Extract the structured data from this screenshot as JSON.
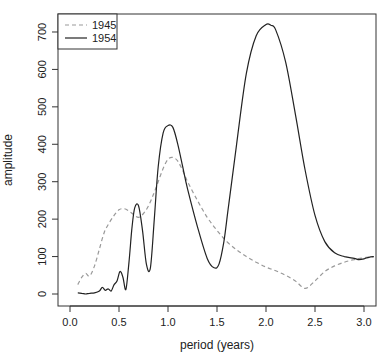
{
  "chart_data": {
    "type": "line",
    "title": "",
    "xlabel": "period (years)",
    "ylabel": "amplitude",
    "xlim": [
      -0.12,
      3.12
    ],
    "ylim": [
      -28,
      752
    ],
    "xticks": [
      0.0,
      0.5,
      1.0,
      1.5,
      2.0,
      2.5,
      3.0
    ],
    "xtick_labels": [
      "0.0",
      "0.5",
      "1.0",
      "1.5",
      "2.0",
      "2.5",
      "3.0"
    ],
    "yticks": [
      0,
      100,
      200,
      300,
      400,
      500,
      600,
      700
    ],
    "ytick_labels": [
      "0",
      "100",
      "200",
      "300",
      "400",
      "500",
      "600",
      "700"
    ],
    "grid": false,
    "legend_position": "top-left",
    "series": [
      {
        "name": "1945",
        "style": "dashed",
        "color": "#999999",
        "x": [
          0.08,
          0.12,
          0.16,
          0.2,
          0.25,
          0.3,
          0.35,
          0.4,
          0.45,
          0.5,
          0.55,
          0.6,
          0.65,
          0.7,
          0.75,
          0.8,
          0.85,
          0.9,
          0.95,
          1.0,
          1.05,
          1.1,
          1.15,
          1.2,
          1.3,
          1.4,
          1.5,
          1.6,
          1.7,
          1.8,
          1.9,
          2.0,
          2.1,
          2.2,
          2.3,
          2.4,
          2.5,
          2.6,
          2.7,
          2.8,
          2.9,
          3.0,
          3.1
        ],
        "y": [
          25,
          45,
          55,
          48,
          75,
          120,
          165,
          190,
          210,
          225,
          228,
          222,
          212,
          205,
          215,
          235,
          265,
          300,
          335,
          360,
          365,
          355,
          330,
          300,
          250,
          205,
          170,
          140,
          118,
          100,
          85,
          72,
          62,
          50,
          35,
          15,
          35,
          60,
          75,
          85,
          92,
          97,
          100
        ]
      },
      {
        "name": "1954",
        "style": "solid",
        "color": "#222222",
        "x": [
          0.08,
          0.12,
          0.16,
          0.2,
          0.25,
          0.3,
          0.33,
          0.36,
          0.39,
          0.42,
          0.45,
          0.48,
          0.51,
          0.54,
          0.57,
          0.6,
          0.63,
          0.66,
          0.7,
          0.74,
          0.78,
          0.82,
          0.86,
          0.9,
          0.95,
          1.0,
          1.05,
          1.1,
          1.15,
          1.2,
          1.3,
          1.4,
          1.47,
          1.52,
          1.57,
          1.62,
          1.7,
          1.8,
          1.9,
          2.0,
          2.05,
          2.1,
          2.2,
          2.3,
          2.4,
          2.5,
          2.6,
          2.7,
          2.8,
          2.9,
          2.95,
          3.0,
          3.05,
          3.1
        ],
        "y": [
          3,
          2,
          0,
          2,
          3,
          8,
          18,
          10,
          14,
          8,
          25,
          35,
          60,
          45,
          12,
          80,
          170,
          230,
          235,
          170,
          80,
          70,
          200,
          340,
          430,
          450,
          445,
          400,
          340,
          280,
          180,
          95,
          70,
          80,
          140,
          240,
          400,
          590,
          690,
          720,
          718,
          705,
          620,
          480,
          330,
          210,
          140,
          110,
          100,
          95,
          92,
          94,
          98,
          100
        ]
      }
    ]
  },
  "legend": {
    "items": [
      {
        "label": "1945",
        "style": "dashed",
        "color": "#999999"
      },
      {
        "label": "1954",
        "style": "solid",
        "color": "#222222"
      }
    ]
  },
  "axes": {
    "xlabel": "period (years)",
    "ylabel": "amplitude"
  }
}
